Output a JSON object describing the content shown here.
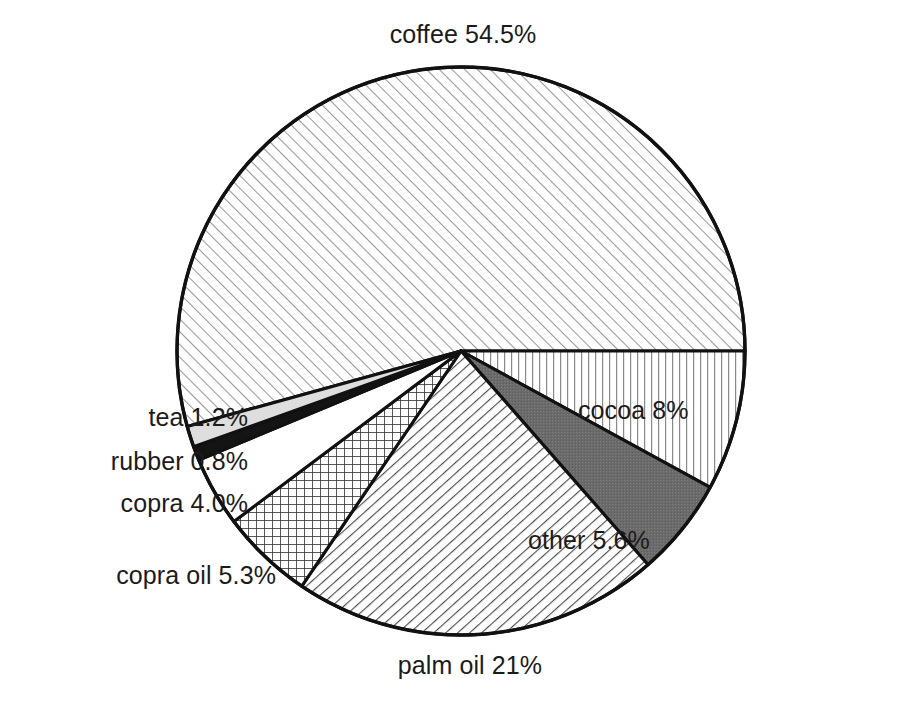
{
  "chart_data": {
    "type": "pie",
    "title": "",
    "subtitle": "",
    "xlabel": "",
    "ylabel": "",
    "legend_position": "none",
    "grid": false,
    "labels_show_percent": true,
    "start_angle_deg": 0,
    "direction": "clockwise",
    "categories": [
      "coffee",
      "cocoa",
      "other",
      "palm oil",
      "copra oil",
      "copra",
      "rubber",
      "tea"
    ],
    "values": [
      54.5,
      8,
      5.6,
      21,
      5.3,
      4.0,
      0.8,
      1.2
    ],
    "slices": [
      {
        "name": "coffee",
        "value": 54.5,
        "label": "coffee 54.5%",
        "percent_text": "54.5%",
        "fill_pattern": "diagonal-hatch-light",
        "fill_color": "#ffffff",
        "line_color": "#8d8d8d",
        "start_deg": 164.6,
        "end_deg": 360.0
      },
      {
        "name": "cocoa",
        "value": 8,
        "label": "cocoa 8%",
        "percent_text": "8%",
        "fill_pattern": "vertical-lines",
        "fill_color": "#ffffff",
        "line_color": "#7a7a7a",
        "start_deg": 0.0,
        "end_deg": 28.7
      },
      {
        "name": "other",
        "value": 5.6,
        "label": "other 5.6%",
        "percent_text": "5.6%",
        "fill_pattern": "solid-dark-gray",
        "fill_color": "#6b6b6b",
        "line_color": "#6b6b6b",
        "start_deg": 28.7,
        "end_deg": 48.8
      },
      {
        "name": "palm oil",
        "value": 21,
        "label": "palm oil 21%",
        "percent_text": "21%",
        "fill_pattern": "diagonal-hatch-dense",
        "fill_color": "#ffffff",
        "line_color": "#5a5a5a",
        "start_deg": 48.8,
        "end_deg": 124.1
      },
      {
        "name": "copra oil",
        "value": 5.3,
        "label": "copra oil 5.3%",
        "percent_text": "5.3%",
        "fill_pattern": "crosshatch-grid",
        "fill_color": "#ffffff",
        "line_color": "#4a4a4a",
        "start_deg": 124.1,
        "end_deg": 143.1
      },
      {
        "name": "copra",
        "value": 4.0,
        "label": "copra 4.0%",
        "percent_text": "4.0%",
        "fill_pattern": "blank-white",
        "fill_color": "#ffffff",
        "line_color": "#111111",
        "start_deg": 143.1,
        "end_deg": 157.4
      },
      {
        "name": "rubber",
        "value": 0.8,
        "label": "rubber 0.8%",
        "percent_text": "0.8%",
        "fill_pattern": "solid-black",
        "fill_color": "#111111",
        "line_color": "#111111",
        "start_deg": 157.4,
        "end_deg": 160.3
      },
      {
        "name": "tea",
        "value": 1.2,
        "label": "tea 1.2%",
        "percent_text": "1.2%",
        "fill_pattern": "solid-light-gray",
        "fill_color": "#dcdcdc",
        "line_color": "#111111",
        "start_deg": 160.3,
        "end_deg": 164.6
      }
    ],
    "labels": {
      "coffee": "coffee 54.5%",
      "cocoa": "cocoa 8%",
      "other": "other 5.6%",
      "palm_oil": "palm oil 21%",
      "copra_oil": "copra oil 5.3%",
      "copra": "copra 4.0%",
      "rubber": "rubber 0.8%",
      "tea": "tea 1.2%"
    },
    "style": {
      "outline_color": "#111111",
      "background": "#ffffff",
      "center_x": 461,
      "center_y": 351,
      "radius": 284
    }
  }
}
